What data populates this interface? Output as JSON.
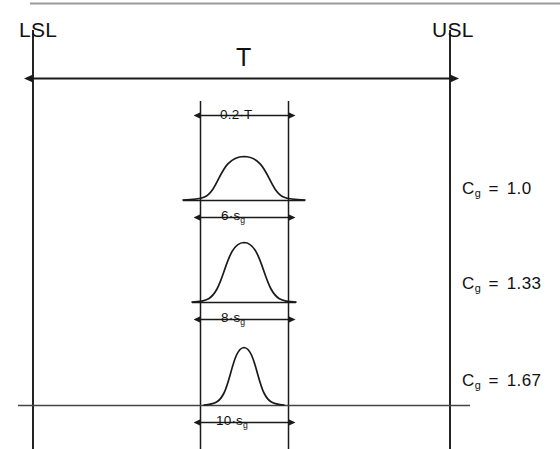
{
  "diagram": {
    "title_implicit": "Gage capability Cg with tolerance band",
    "spec_limits": {
      "lower_label": "LSL",
      "upper_label": "USL"
    },
    "tolerance": {
      "label": "T",
      "band_label": "0.2·T"
    },
    "distributions": [
      {
        "width_label": "6·s",
        "width_subscript": "g",
        "cg_symbol": "C",
        "cg_subscript": "g",
        "cg_equals": "=",
        "cg_value": "1.0",
        "spread_factor": 6,
        "relative_sigma": 1.0
      },
      {
        "width_label": "8·s",
        "width_subscript": "g",
        "cg_symbol": "C",
        "cg_subscript": "g",
        "cg_equals": "=",
        "cg_value": "1.33",
        "spread_factor": 8,
        "relative_sigma": 0.75
      },
      {
        "width_label": "10·s",
        "width_subscript": "g",
        "cg_symbol": "C",
        "cg_subscript": "g",
        "cg_equals": "=",
        "cg_value": "1.67",
        "spread_factor": 10,
        "relative_sigma": 0.6
      }
    ],
    "colors": {
      "ink": "#111111",
      "line": "#1a1a1a",
      "scan_line": "#9a9a9a",
      "background": "#ffffff"
    }
  }
}
